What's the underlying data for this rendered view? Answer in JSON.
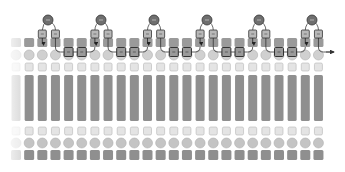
{
  "diagram": {
    "title": "",
    "columns": {
      "count": 24,
      "start_x": 16,
      "spacing": 13.15,
      "faded_first": true
    },
    "rows": [
      {
        "name": "top-square-row",
        "shape": "square",
        "y": 38,
        "h": 9,
        "w": 10,
        "fill": "#9a9a9a"
      },
      {
        "name": "upper-circle-row",
        "shape": "circle",
        "y": 55,
        "r": 5,
        "fill": "#d0d0d0"
      },
      {
        "name": "upper-small-square-row",
        "shape": "small-square",
        "y": 63,
        "h": 8,
        "w": 8,
        "fill": "#e4e4e4"
      },
      {
        "name": "tall-bar-row",
        "shape": "bar",
        "y": 75,
        "h": 46,
        "w": 9,
        "fill": "#8f8f8f"
      },
      {
        "name": "lower-small-square-row",
        "shape": "small-square",
        "y": 127,
        "h": 8,
        "w": 8,
        "fill": "#e4e4e4"
      },
      {
        "name": "lower-circle-row",
        "shape": "circle",
        "y": 143,
        "r": 5,
        "fill": "#c4c4c4"
      },
      {
        "name": "bottom-square-row",
        "shape": "square",
        "y": 150,
        "h": 10,
        "w": 10,
        "fill": "#8f8f8f"
      }
    ],
    "trees": [
      {
        "root_x": 48,
        "left_col": 2,
        "right_col": 3
      },
      {
        "root_x": 101,
        "left_col": 6,
        "right_col": 7
      },
      {
        "root_x": 154,
        "left_col": 10,
        "right_col": 11
      },
      {
        "root_x": 207,
        "left_col": 14,
        "right_col": 15
      },
      {
        "root_x": 259,
        "left_col": 18,
        "right_col": 19
      },
      {
        "root_x": 312,
        "left_col": 22,
        "right_col": 23
      }
    ],
    "chain": {
      "y": 52,
      "box_fill": "#9a9a9a",
      "line_color": "#333333",
      "arrow_end_x": 334
    },
    "colors": {
      "root_node": "#6f6f6f",
      "leaf_box": "#b8b8b8",
      "stroke": "#444444"
    }
  }
}
